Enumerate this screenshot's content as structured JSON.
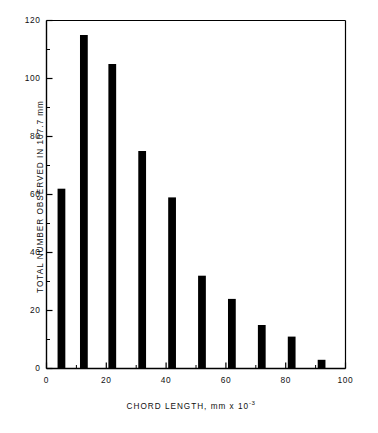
{
  "chart_data": {
    "type": "bar",
    "title": "",
    "subtitle": "",
    "xlabel": "CHORD LENGTH, mm x 10",
    "xlabel_exponent": "-3",
    "ylabel": "TOTAL NUMBER OBSERVED IN 107.7 mm",
    "xlim": [
      0,
      100
    ],
    "ylim": [
      0,
      120
    ],
    "grid": false,
    "legend": "none",
    "x_major_ticks": [
      0,
      20,
      40,
      60,
      80,
      100
    ],
    "x_minor_ticks": [
      10,
      30,
      50,
      70,
      90
    ],
    "x_tick_labels": [
      "0",
      "20",
      "40",
      "60",
      "80",
      "100"
    ],
    "y_major_ticks": [
      0,
      20,
      40,
      60,
      80,
      100,
      120
    ],
    "y_minor_ticks": [
      10,
      30,
      50,
      70,
      90,
      110
    ],
    "y_tick_labels": [
      "0",
      "20",
      "40",
      "60",
      "80",
      "100",
      "120"
    ],
    "bar_color": "#000000",
    "axis_color": "#000000",
    "background_color": "#ffffff",
    "bar_width_units": 2.6,
    "x": [
      5,
      12.5,
      22,
      32,
      42,
      52,
      62,
      72,
      82,
      92
    ],
    "values": [
      62,
      115,
      105,
      75,
      59,
      32,
      24,
      15,
      11,
      3
    ],
    "categories": [
      "5",
      "12.5",
      "22",
      "32",
      "42",
      "52",
      "62",
      "72",
      "82",
      "92"
    ],
    "series": [
      {
        "name": "Total number observed",
        "values": [
          62,
          115,
          105,
          75,
          59,
          32,
          24,
          15,
          11,
          3
        ]
      }
    ]
  }
}
